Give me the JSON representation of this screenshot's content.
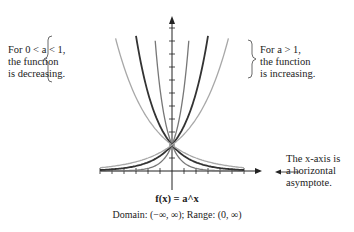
{
  "figure": {
    "title": "f(x) = a^x",
    "caption": "Domain: (−∞, ∞); Range: (0, ∞)"
  },
  "annotations": {
    "decreasing": [
      "For 0 < a < 1,",
      "the function",
      "is decreasing."
    ],
    "increasing": [
      "For a > 1,",
      "the function",
      "is increasing."
    ],
    "asymptote": [
      "The x-axis is",
      "a horizontal",
      "asymptote."
    ]
  },
  "axes": {
    "x_label": "x",
    "y_label": "y",
    "x_ticks": [
      "−3",
      "−2",
      "−1",
      "0",
      "1",
      "2",
      "3"
    ],
    "y_ticks": [
      "3",
      "4",
      "5"
    ]
  },
  "chart_data": {
    "type": "line",
    "title": "f(x) = a^x",
    "xlabel": "x",
    "ylabel": "y",
    "xlim": [
      -3,
      3
    ],
    "ylim": [
      0,
      5.5
    ],
    "grid": false,
    "measured_from_figure": {
      "note": "Values read directly off the image: axis tick labels, the shared y-intercept, and the curve equations printed as labels.",
      "shared_point": [
        0,
        1
      ],
      "x_tick_labels": [
        -3,
        -2,
        -1,
        0,
        1,
        2,
        3
      ],
      "y_tick_labels": [
        3,
        4,
        5
      ],
      "x_tick_spacing": 0.5,
      "y_tick_spacing": 0.5
    },
    "curve_samples_source": "computed from f(x)=a^x for each labeled base a; NOT measured from the pixels",
    "x": [
      -1.5,
      -1,
      -0.5,
      0,
      0.5,
      1,
      1.5
    ],
    "series": [
      {
        "name": "f(x) = (1/10)^x",
        "base": 0.1,
        "shade": "mid",
        "values": [
          31.62,
          10,
          3.16,
          1,
          0.32,
          0.1,
          0.03
        ]
      },
      {
        "name": "f(x) = (1/3)^x",
        "base": 0.3333,
        "shade": "dark",
        "values": [
          5.2,
          3,
          1.73,
          1,
          0.58,
          0.33,
          0.19
        ]
      },
      {
        "name": "f(x) = (1/2)^x",
        "base": 0.5,
        "shade": "light",
        "values": [
          2.83,
          2,
          1.41,
          1,
          0.71,
          0.5,
          0.35
        ]
      },
      {
        "name": "f(x) = 10^x",
        "base": 10,
        "shade": "mid",
        "values": [
          0.03,
          0.1,
          0.32,
          1,
          3.16,
          10,
          31.62
        ]
      },
      {
        "name": "f(x) = 3^x",
        "base": 3,
        "shade": "dark",
        "values": [
          0.19,
          0.33,
          0.58,
          1,
          1.73,
          3,
          5.2
        ]
      },
      {
        "name": "f(x) = 2^x",
        "base": 2,
        "shade": "light",
        "values": [
          0.35,
          0.5,
          0.71,
          1,
          1.41,
          2,
          2.83
        ]
      }
    ],
    "annotations": [
      "For 0 < a < 1, the function is decreasing.",
      "For a > 1, the function is increasing.",
      "The x-axis is a horizontal asymptote."
    ],
    "caption": "Domain: (−∞, ∞); Range: (0, ∞)"
  },
  "colors": {
    "dark": "#333333",
    "mid": "#777777",
    "light": "#a8a8a8",
    "axis": "#222222"
  }
}
